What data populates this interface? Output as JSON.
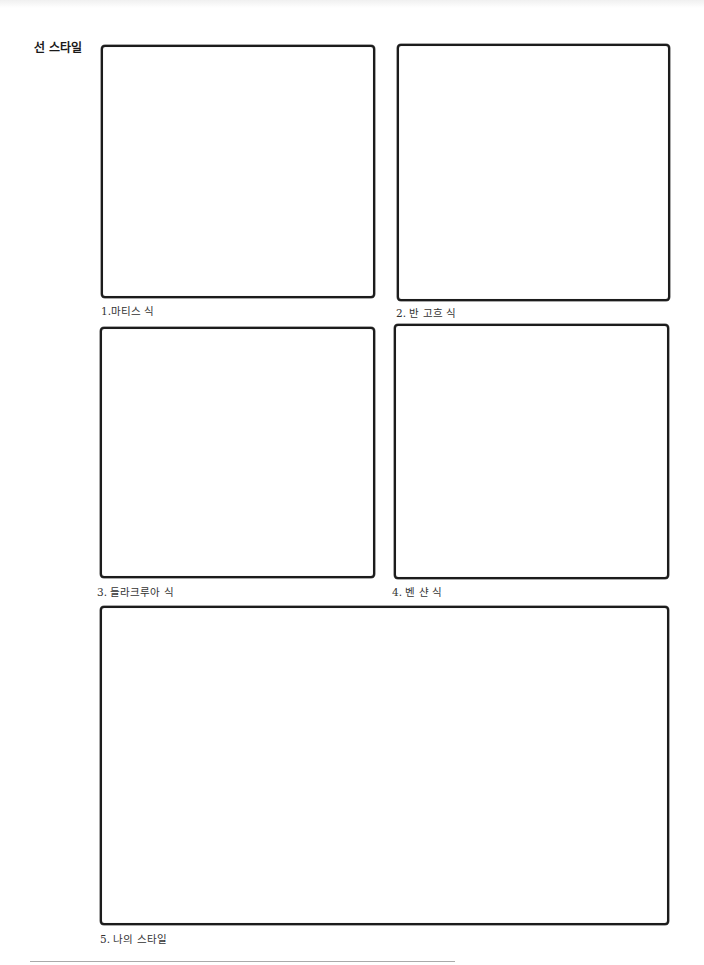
{
  "section": {
    "title": "선 스타일"
  },
  "panels": [
    {
      "label": "1.마티스 식"
    },
    {
      "label": "2. 반 고흐 식"
    },
    {
      "label": "3. 들라크루아 식"
    },
    {
      "label": "4. 벤 샨 식"
    },
    {
      "label": "5. 나의 스타일"
    }
  ]
}
